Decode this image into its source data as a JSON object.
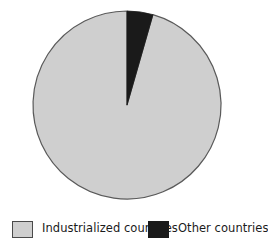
{
  "chart_data": {
    "type": "pie",
    "title": "",
    "subtitle": "",
    "xlabel": "",
    "ylabel": "",
    "grid": false,
    "legend_position": "bottom",
    "start_angle_deg": 0,
    "direction": "clockwise",
    "categories": [
      "Industrialized countries",
      "Other countries"
    ],
    "values": [
      95.5,
      4.5
    ],
    "slices": [
      {
        "label": "Industrialized countries",
        "value": 95.5,
        "percent": 95.5,
        "color": "#cfcfcf",
        "start_angle_deg": 16,
        "end_angle_deg": 360
      },
      {
        "label": "Other countries",
        "value": 4.5,
        "percent": 4.5,
        "color": "#1a1a1a",
        "start_angle_deg": 0,
        "end_angle_deg": 16
      }
    ],
    "annotations": []
  },
  "pie": {
    "center_x": 127,
    "center_y": 105,
    "radius": 94,
    "outline_color": "#5a5a5a",
    "outline_width": 1.2
  },
  "legend": {
    "entries": [
      {
        "label": "Industrialized countries",
        "color": "#cfcfcf",
        "swatch_name": "legend-swatch-industrialized"
      },
      {
        "label": "Other countries",
        "color": "#1a1a1a",
        "swatch_name": "legend-swatch-other"
      }
    ]
  },
  "colors": {
    "slice_light": "#cfcfcf",
    "slice_dark": "#1a1a1a",
    "outline": "#5a5a5a",
    "text": "#1b1b1b",
    "background": "#ffffff"
  }
}
